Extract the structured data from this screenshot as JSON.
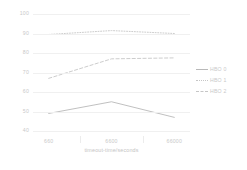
{
  "chart_data": {
    "type": "line",
    "title": "",
    "xlabel": "timeout-time/seconds",
    "ylabel": "",
    "categories": [
      "660",
      "6600",
      "66000"
    ],
    "ylim": [
      40,
      100
    ],
    "yticks": [
      40,
      50,
      60,
      70,
      80,
      90,
      100
    ],
    "grid": true,
    "legend_position": "right",
    "series": [
      {
        "name": "HBO 0",
        "values": [
          49.0,
          55.0,
          47.0
        ],
        "style": "solid",
        "color": "#b9b9b9"
      },
      {
        "name": "HBO 1",
        "values": [
          89.5,
          91.5,
          90.0
        ],
        "style": "dotted",
        "color": "#c6c6c6"
      },
      {
        "name": "HBO 2",
        "values": [
          67.0,
          77.0,
          77.5
        ],
        "style": "dashed",
        "color": "#c6c6c6"
      }
    ]
  },
  "axis": {
    "y_tick_labels": [
      "100",
      "90",
      "80",
      "70",
      "60",
      "50",
      "40"
    ],
    "x_tick_labels": [
      "660",
      "6600",
      "66000"
    ],
    "x_title": "timeout-time/seconds"
  },
  "legend": {
    "items": [
      {
        "label": "HBO 0"
      },
      {
        "label": "HBO 1"
      },
      {
        "label": "HBO 2"
      }
    ]
  },
  "colors": {
    "grid": "#f0f0f0",
    "text": "#c9c9c9",
    "series_solid": "#b9b9b9",
    "series_dotted": "#c6c6c6",
    "series_dashed": "#c6c6c6",
    "background": "#ffffff"
  }
}
